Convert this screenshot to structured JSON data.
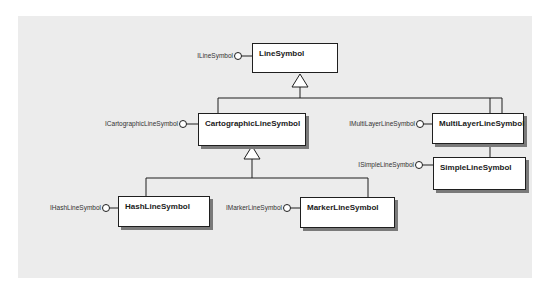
{
  "diagram": {
    "type": "UML class diagram",
    "classes": [
      {
        "id": "LineSymbol",
        "name": "LineSymbol",
        "interface": "ILineSymbol",
        "abstract": true
      },
      {
        "id": "CartographicLineSymbol",
        "name": "CartographicLineSymbol",
        "interface": "ICartographicLineSymbol",
        "parent": "LineSymbol"
      },
      {
        "id": "MultiLayerLineSymbol",
        "name": "MultiLayerLineSymbol",
        "interface": "IMultiLayerLineSymbol",
        "parent": "LineSymbol"
      },
      {
        "id": "SimpleLineSymbol",
        "name": "SimpleLineSymbol",
        "interface": "ISimpleLineSymbol",
        "composed_in": "MultiLayerLineSymbol"
      },
      {
        "id": "HashLineSymbol",
        "name": "HashLineSymbol",
        "interface": "IHashLineSymbol",
        "parent": "CartographicLineSymbol"
      },
      {
        "id": "MarkerLineSymbol",
        "name": "MarkerLineSymbol",
        "interface": "IMarkerLineSymbol",
        "parent": "CartographicLineSymbol"
      }
    ],
    "colors": {
      "background": "#ececec",
      "box": "#ffffff",
      "line": "#1f1f1f",
      "shadow": "#7a7a7a"
    }
  }
}
